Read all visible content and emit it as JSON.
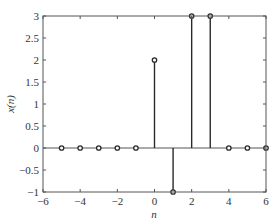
{
  "chart_data": {
    "type": "stem",
    "title": "",
    "xlabel": "n",
    "ylabel": "x(n)",
    "xlim": [
      -6,
      6
    ],
    "ylim": [
      -1,
      3
    ],
    "xticks": [
      -6,
      -4,
      -2,
      0,
      2,
      4,
      6
    ],
    "xtick_labels": [
      "−6",
      "−4",
      "−2",
      "0",
      "2",
      "4",
      "6"
    ],
    "yticks": [
      -1,
      -0.5,
      0,
      0.5,
      1,
      1.5,
      2,
      2.5,
      3
    ],
    "ytick_labels": [
      "−1",
      "−0.5",
      "0",
      "0.5",
      "1",
      "1.5",
      "2",
      "2.5",
      "3"
    ],
    "grid": false,
    "legend": null,
    "x": [
      -5,
      -4,
      -3,
      -2,
      -1,
      0,
      1,
      2,
      3,
      4,
      5,
      6
    ],
    "values": [
      0,
      0,
      0,
      0,
      0,
      2,
      -1,
      3,
      3,
      0,
      0,
      0
    ],
    "marker": "circle",
    "colors": {
      "stem": "#2a2a2a",
      "axis": "#555555",
      "baseline": "#555555"
    }
  }
}
